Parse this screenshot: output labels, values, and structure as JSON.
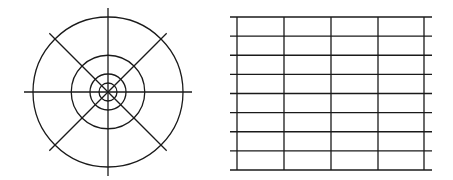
{
  "figure": {
    "line_color": "#1a1a1a",
    "background": "#ffffff"
  },
  "polar_diagram": {
    "ring_count": 4,
    "ring_radius_ratios": [
      1.0,
      0.49,
      0.24,
      0.12
    ],
    "spoke_angles_deg": [
      0,
      45,
      90,
      135
    ],
    "spokes_extend_beyond_outer_ring": true
  },
  "grid_diagram": {
    "horizontal_line_count": 9,
    "vertical_line_count": 5,
    "rows": 8,
    "columns": 4,
    "horizontal_lines_extend_beyond_verticals": true
  }
}
